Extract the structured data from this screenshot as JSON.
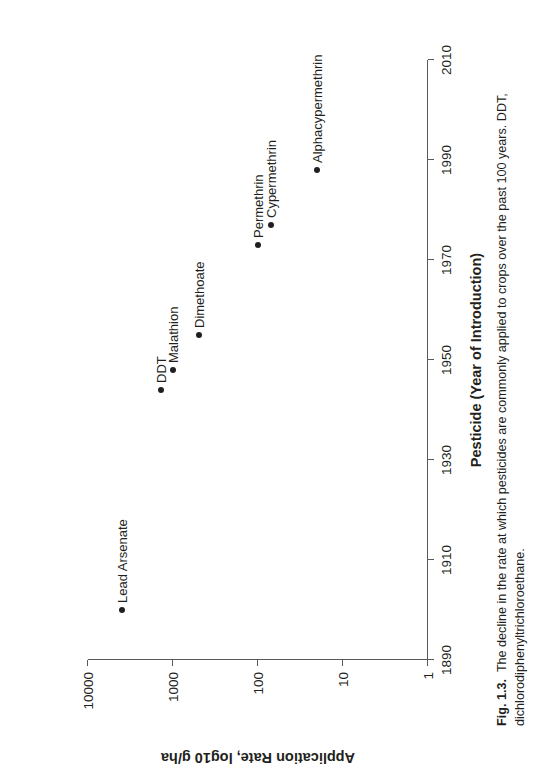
{
  "figure": {
    "number_label": "Fig. 1.3.",
    "caption": "The decline in the rate at which pesticides are commonly applied to crops over the past 100 years. DDT, dichlorodiphenyltrichloroethane."
  },
  "chart_data": {
    "type": "scatter",
    "title": "",
    "xlabel": "Pesticide (Year of Introduction)",
    "ylabel": "Application Rate, log10 g/ha",
    "xlim": [
      1890,
      2010
    ],
    "ylim": [
      1,
      10000
    ],
    "yscale": "log",
    "grid": false,
    "legend": false,
    "xticks": [
      "1890",
      "1910",
      "1930",
      "1950",
      "1970",
      "1990",
      "2010"
    ],
    "yticks": [
      "1",
      "10",
      "100",
      "1000",
      "10000"
    ],
    "points": [
      {
        "label": "Lead Arsenate",
        "x": 1900,
        "y": 4000
      },
      {
        "label": "DDT",
        "x": 1944,
        "y": 1400
      },
      {
        "label": "Malathion",
        "x": 1948,
        "y": 1000
      },
      {
        "label": "Dimethoate",
        "x": 1955,
        "y": 500
      },
      {
        "label": "Permethrin",
        "x": 1973,
        "y": 100
      },
      {
        "label": "Cypermethrin",
        "x": 1977,
        "y": 70
      },
      {
        "label": "Alphacypermethrin",
        "x": 1988,
        "y": 20
      }
    ]
  }
}
